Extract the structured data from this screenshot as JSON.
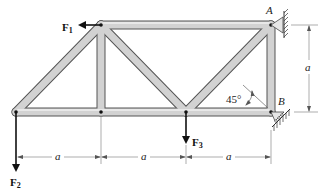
{
  "diagram": {
    "type": "truss",
    "forces": [
      {
        "name": "F1",
        "label": "F",
        "sub": "1",
        "direction": "left",
        "joint": "top-left"
      },
      {
        "name": "F2",
        "label": "F",
        "sub": "2",
        "direction": "down",
        "joint": "bottom-left"
      },
      {
        "name": "F3",
        "label": "F",
        "sub": "3",
        "direction": "down",
        "joint": "bottom-middle"
      }
    ],
    "supports": {
      "A": {
        "label": "A",
        "type": "pin"
      },
      "B": {
        "label": "B",
        "type": "roller",
        "angle_label": "45°"
      }
    },
    "dimensions": {
      "horizontal": [
        "a",
        "a",
        "a"
      ],
      "vertical": "a"
    },
    "colors": {
      "member_fill": "#cfcfcf",
      "member_stroke": "#555555",
      "force": "#111111",
      "dimension": "#777777"
    }
  }
}
